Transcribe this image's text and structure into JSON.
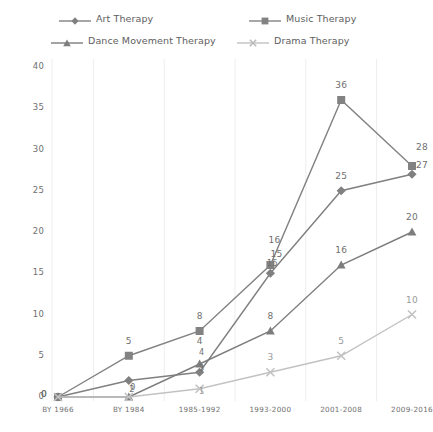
{
  "chart_data": {
    "type": "line",
    "title": "",
    "xlabel": "",
    "ylabel": "",
    "categories": [
      "BY 1966",
      "BY 1984",
      "1985-1992",
      "1993-2000",
      "2001-2008",
      "2009-2016"
    ],
    "ylim": [
      0,
      40
    ],
    "yticks": [
      0,
      5,
      10,
      15,
      20,
      25,
      30,
      35,
      40
    ],
    "grid": "vertical",
    "legend_position": "top",
    "series": [
      {
        "name": "Art Therapy",
        "marker": "diamond",
        "color": "#808080",
        "values": [
          0,
          2,
          3,
          15,
          25,
          27
        ],
        "labels": [
          "0",
          "2",
          "3",
          "15",
          "25",
          "27"
        ]
      },
      {
        "name": "Music Therapy",
        "marker": "square",
        "color": "#828282",
        "values": [
          0,
          5,
          8,
          16,
          36,
          28
        ],
        "labels": [
          "0",
          "5",
          "8",
          "16",
          "36",
          "28"
        ]
      },
      {
        "name": "Dance Movement Therapy",
        "marker": "triangle",
        "color": "#7d7d7d",
        "values": [
          0,
          0,
          4,
          8,
          16,
          20
        ],
        "labels": [
          "0",
          "0",
          "4",
          "8",
          "16",
          "20"
        ]
      },
      {
        "name": "Drama Therapy",
        "marker": "x",
        "color": "#c2c2c2",
        "values": [
          0,
          0,
          1,
          3,
          5,
          10
        ],
        "labels": [
          "0",
          "0",
          "1",
          "3",
          "5",
          "10"
        ]
      }
    ]
  },
  "colors": {
    "background": "#ffffff",
    "gridline": "#ededed",
    "text": "#6f6f6f",
    "art": "#808080",
    "music": "#828282",
    "dance": "#7d7d7d",
    "drama": "#c2c2c2"
  }
}
